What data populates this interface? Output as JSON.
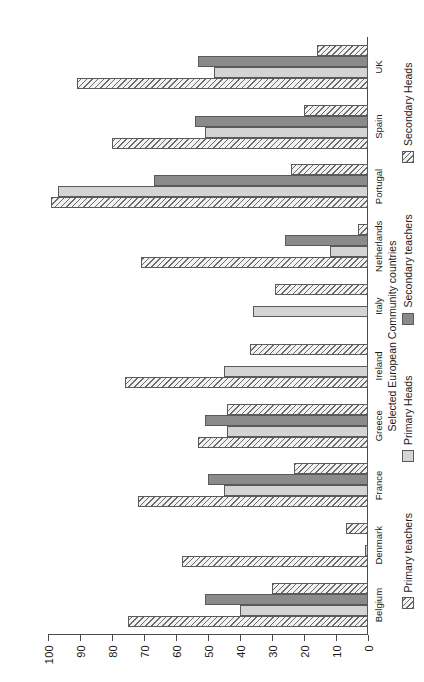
{
  "chart_data": {
    "type": "bar",
    "orientation": "vertical-rotated",
    "title": "",
    "xlabel": "Selected European Community countries",
    "ylabel": "%",
    "ylim": [
      0,
      100
    ],
    "ytick_step": 10,
    "grid": false,
    "legend_position": "bottom",
    "yticks": [
      "0",
      "10",
      "20",
      "30",
      "40",
      "50",
      "60",
      "70",
      "80",
      "90",
      "100"
    ],
    "categories": [
      "Belgium",
      "Denmark",
      "France",
      "Greece",
      "Ireland",
      "Italy",
      "Netherlands",
      "Portugal",
      "Spain",
      "UK"
    ],
    "series": [
      {
        "name": "Primary teachers",
        "swatch": "hatched",
        "values": [
          75,
          58,
          72,
          53,
          76,
          0,
          71,
          99,
          80,
          91
        ]
      },
      {
        "name": "Primary Heads",
        "swatch": "light-gray",
        "values": [
          40,
          1,
          45,
          44,
          45,
          36,
          12,
          97,
          51,
          48
        ]
      },
      {
        "name": "Secondary teachers",
        "swatch": "dark-gray",
        "values": [
          51,
          0,
          50,
          51,
          0,
          0,
          26,
          67,
          54,
          53
        ]
      },
      {
        "name": "Secondary Heads",
        "swatch": "hatched",
        "values": [
          30,
          7,
          23,
          44,
          37,
          29,
          3,
          24,
          20,
          16
        ]
      }
    ]
  },
  "axis": {
    "value_axis_title": "%",
    "category_axis_title": "Selected European Community countries"
  }
}
